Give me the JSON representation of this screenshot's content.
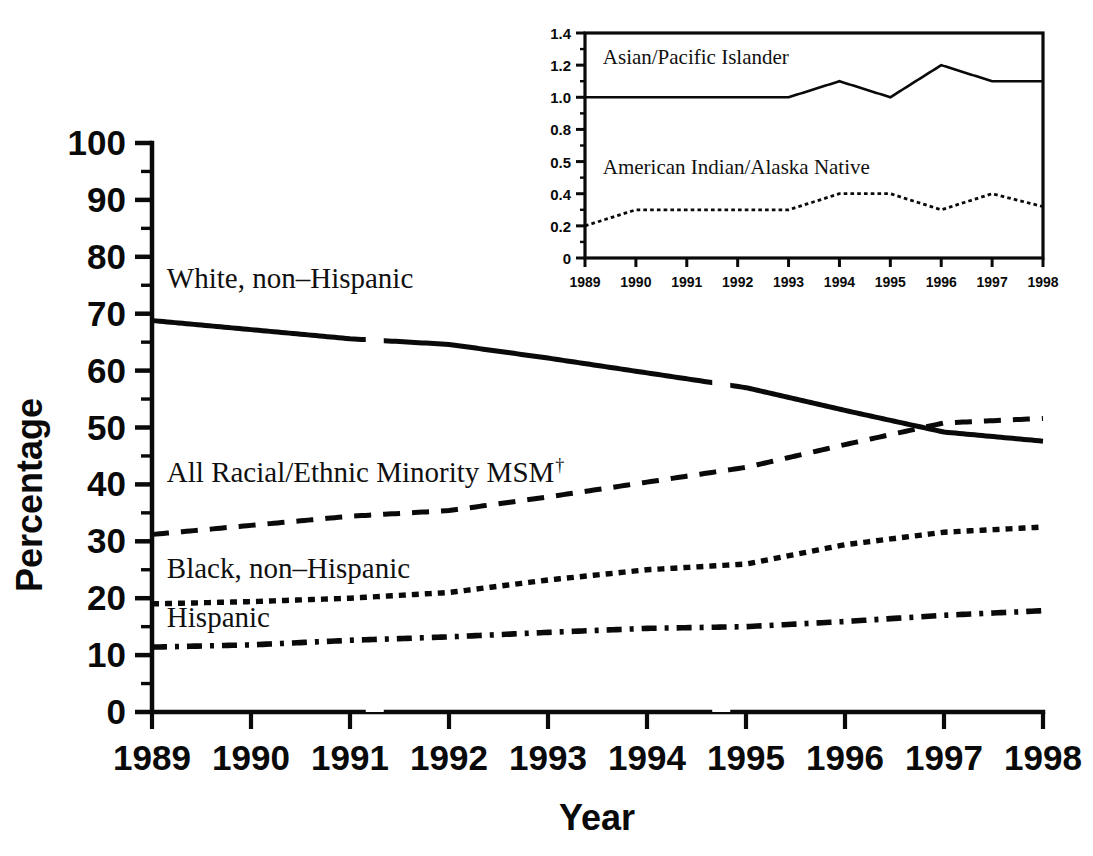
{
  "chart_data": [
    {
      "id": "main",
      "type": "line",
      "title": "",
      "xlabel": "Year",
      "ylabel": "Percentage",
      "xlim": [
        1989,
        1998
      ],
      "ylim": [
        0,
        100
      ],
      "grid": false,
      "legend_position": "inline-labels",
      "xticks": [
        "1989",
        "1990",
        "1991",
        "1992",
        "1993",
        "1994",
        "1995",
        "1996",
        "1997",
        "1998"
      ],
      "yticks": [
        "0",
        "10",
        "20",
        "30",
        "40",
        "50",
        "60",
        "70",
        "80",
        "90",
        "100"
      ],
      "minor_tick_step": 5,
      "x": [
        1989,
        1990,
        1991,
        1992,
        1993,
        1994,
        1995,
        1996,
        1997,
        1998
      ],
      "series": [
        {
          "name": "White, non–Hispanic",
          "style": "solid",
          "label_x": 1989.15,
          "label_y": 74.5,
          "values": [
            68.8,
            67.2,
            65.6,
            64.6,
            62.2,
            59.6,
            57.0,
            53.0,
            49.2,
            47.6
          ]
        },
        {
          "name": "All Racial/Ethnic Minority MSM†",
          "style": "dashed",
          "label_x": 1989.15,
          "label_y": 40.5,
          "values": [
            31.2,
            32.8,
            34.4,
            35.4,
            37.8,
            40.4,
            43.0,
            47.0,
            50.8,
            51.6
          ]
        },
        {
          "name": "Black, non–Hispanic",
          "style": "dotted",
          "label_x": 1989.15,
          "label_y": 23.5,
          "values": [
            19.0,
            19.4,
            20.0,
            21.0,
            23.2,
            25.0,
            26.0,
            29.4,
            31.6,
            32.5
          ]
        },
        {
          "name": "Hispanic",
          "style": "dashdot",
          "label_x": 1989.15,
          "label_y": 15.0,
          "values": [
            11.4,
            11.8,
            12.6,
            13.2,
            14.0,
            14.7,
            15.0,
            15.9,
            17.0,
            17.8
          ]
        }
      ]
    },
    {
      "id": "inset",
      "type": "line",
      "title": "",
      "xlabel": "",
      "ylabel": "",
      "xlim": [
        1989,
        1998
      ],
      "ylim": [
        0,
        1.4
      ],
      "grid": false,
      "legend_position": "inline-labels",
      "framed": true,
      "xticks": [
        "1989",
        "1990",
        "1991",
        "1992",
        "1993",
        "1994",
        "1995",
        "1996",
        "1997",
        "1998"
      ],
      "yticks": [
        "0",
        "0.2",
        "0.4",
        "0.5",
        "0.8",
        "1.0",
        "1.2",
        "1.4"
      ],
      "ytick_values": [
        0,
        0.2,
        0.4,
        0.6,
        0.8,
        1.0,
        1.2,
        1.4
      ],
      "x": [
        1989,
        1990,
        1991,
        1992,
        1993,
        1994,
        1995,
        1996,
        1997,
        1998
      ],
      "series": [
        {
          "name": "Asian/Pacific Islander",
          "style": "solid",
          "label_x": 1989.35,
          "label_y": 1.21,
          "values": [
            1.0,
            1.0,
            1.0,
            1.0,
            1.0,
            1.1,
            1.0,
            1.2,
            1.1,
            1.1
          ]
        },
        {
          "name": "American Indian/Alaska Native",
          "style": "dotted",
          "label_x": 1989.35,
          "label_y": 0.52,
          "values": [
            0.2,
            0.3,
            0.3,
            0.3,
            0.3,
            0.4,
            0.4,
            0.3,
            0.4,
            0.32
          ]
        }
      ]
    }
  ],
  "main_chart": {
    "y_axis_title": "Percentage",
    "x_axis_title": "Year",
    "y_tick_labels": [
      "100",
      "90",
      "80",
      "70",
      "60",
      "50",
      "40",
      "30",
      "20",
      "10",
      "0"
    ],
    "x_tick_labels": [
      "1989",
      "1990",
      "1991",
      "1992",
      "1993",
      "1994",
      "1995",
      "1996",
      "1997",
      "1998"
    ],
    "series_labels": {
      "white": "White, non–Hispanic",
      "minority": "All Racial/Ethnic Minority MSM",
      "minority_footnote_marker": "†",
      "black": "Black, non–Hispanic",
      "hispanic": "Hispanic"
    }
  },
  "inset_chart": {
    "y_tick_labels": [
      "1.4",
      "1.2",
      "1.0",
      "0.8",
      "0.5",
      "0.4",
      "0.2",
      "0"
    ],
    "x_tick_labels": [
      "1989",
      "1990",
      "1991",
      "1992",
      "1993",
      "1994",
      "1995",
      "1996",
      "1997",
      "1998"
    ],
    "series_labels": {
      "asian": "Asian/Pacific Islander",
      "american_indian": "American Indian/Alaska Native"
    }
  },
  "colors": {
    "ink": "#0a0a0a",
    "background": "#ffffff"
  }
}
